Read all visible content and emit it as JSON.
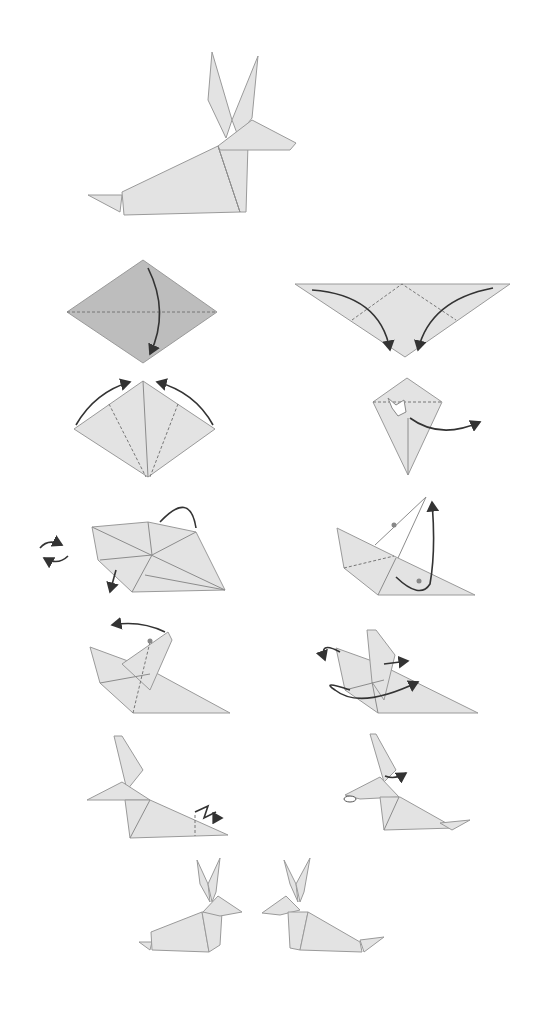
{
  "diagram": {
    "colors": {
      "background": "#ffffff",
      "paper": "#e3e3e3",
      "paper_colored_side": "#bdbdbd",
      "edge": "#9a9a9a",
      "arrow": "#333333"
    },
    "final_model": {
      "label": "Finished rabbit (facing right)"
    },
    "steps": [
      {
        "n": 1,
        "label": "Fold diamond in half downward along horizontal diagonal"
      },
      {
        "n": 2,
        "label": "Fold both outer corners down to the bottom point"
      },
      {
        "n": 3,
        "label": "Fold edges to center crease and unfold (arrows up)"
      },
      {
        "n": 4,
        "label": "Squash fold and swing flap outward"
      },
      {
        "n": 5,
        "label": "Turn over; fold flap behind"
      },
      {
        "n": 6,
        "label": "Inside-reverse fold the point upward"
      },
      {
        "n": 7,
        "label": "Pull the ear flap back"
      },
      {
        "n": 8,
        "label": "Wrap and fold head layers"
      },
      {
        "n": 9,
        "label": "Crimp fold the tail"
      },
      {
        "n": 10,
        "label": "Shape the nose and ears"
      }
    ],
    "result_pair": {
      "label": "Two finished rabbits facing each other"
    }
  }
}
